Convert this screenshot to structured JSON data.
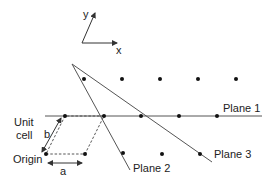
{
  "axes": {
    "x_label": "x",
    "y_label": "y"
  },
  "labels": {
    "unit_cell_line1": "Unit",
    "unit_cell_line2": "cell",
    "origin": "Origin",
    "a": "a",
    "b": "b",
    "plane1": "Plane 1",
    "plane2": "Plane 2",
    "plane3": "Plane 3"
  },
  "colors": {
    "line": "#333333",
    "dot": "#111111",
    "background": "#ffffff"
  }
}
